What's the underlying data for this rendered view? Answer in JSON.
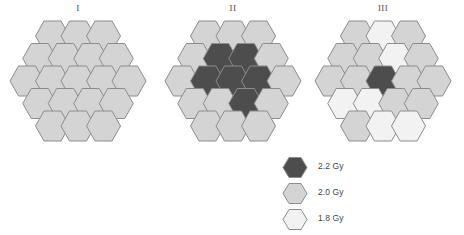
{
  "figure": {
    "background": "#ffffff",
    "hex_stroke": "#8c8c8c"
  },
  "dose_colors": {
    "high": "#4d4d4d",
    "medium": "#d4d4d4",
    "low": "#f2f2f2"
  },
  "legend": {
    "name": "dose-legend",
    "items": [
      {
        "key": "high",
        "label": "2.2 Gy",
        "color": "#4d4d4d"
      },
      {
        "key": "medium",
        "label": "2.0 Gy",
        "color": "#d4d4d4"
      },
      {
        "key": "low",
        "label": "1.8 Gy",
        "color": "#f2f2f2"
      }
    ]
  },
  "layout": {
    "description": "flat-top hexagons, rows of 3/4/5/4/3 = 19 cells",
    "rows": [
      3,
      4,
      5,
      4,
      3
    ],
    "cell_count": 19,
    "hex_width": 34,
    "hex_height": 30,
    "row_step": 22.5,
    "col_step": 25.5
  },
  "panels": [
    {
      "id": "panel-1",
      "title": "I",
      "name": "hex-cluster-I",
      "cells": [
        [
          "medium",
          "medium",
          "medium"
        ],
        [
          "medium",
          "medium",
          "medium",
          "medium"
        ],
        [
          "medium",
          "medium",
          "medium",
          "medium",
          "medium"
        ],
        [
          "medium",
          "medium",
          "medium",
          "medium"
        ],
        [
          "medium",
          "medium",
          "medium"
        ]
      ]
    },
    {
      "id": "panel-2",
      "title": "II",
      "name": "hex-cluster-II",
      "cells": [
        [
          "medium",
          "medium",
          "medium"
        ],
        [
          "medium",
          "high",
          "high",
          "medium"
        ],
        [
          "medium",
          "high",
          "high",
          "high",
          "medium"
        ],
        [
          "medium",
          "medium",
          "high",
          "medium"
        ],
        [
          "medium",
          "medium",
          "medium"
        ]
      ]
    },
    {
      "id": "panel-3",
      "title": "III",
      "name": "hex-cluster-III",
      "cells": [
        [
          "medium",
          "low",
          "medium"
        ],
        [
          "medium",
          "medium",
          "low",
          "medium"
        ],
        [
          "medium",
          "medium",
          "high",
          "medium",
          "medium"
        ],
        [
          "low",
          "low",
          "medium",
          "medium"
        ],
        [
          "medium",
          "low",
          "low"
        ]
      ]
    }
  ]
}
